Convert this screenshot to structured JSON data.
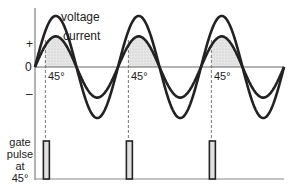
{
  "labels": {
    "voltage": "voltage",
    "current": "current",
    "plus": "+",
    "zero": "0",
    "minus": "–",
    "angle": "45°",
    "gate_line1": "gate",
    "gate_line2": "pulse",
    "gate_line3": "at",
    "gate_line4": "45°"
  },
  "waveform": {
    "cycles": 3,
    "firing_angle_deg": 45,
    "voltage_amplitude": 1.0,
    "current_amplitude": 0.6,
    "colors": {
      "curve": "#222222",
      "shade": "#d9d9d9",
      "pulse_fill": "#e0e0e0",
      "axis": "#555555"
    }
  }
}
